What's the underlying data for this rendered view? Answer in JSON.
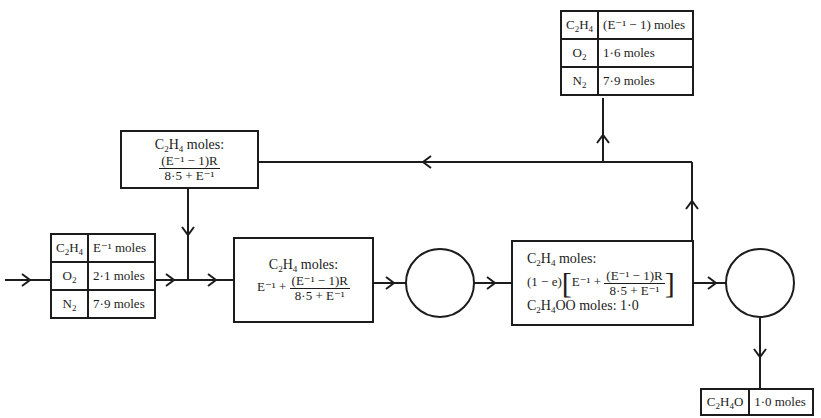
{
  "diagram": {
    "type": "process-flow",
    "colors": {
      "line": "#1c1c1c",
      "background": "#ffffff"
    },
    "feed_table": {
      "rows": [
        {
          "species": "C2H4",
          "species_html": "C<sub>2</sub>H<sub>4</sub>",
          "amount": "E⁻¹ moles"
        },
        {
          "species": "O2",
          "species_html": "O<sub>2</sub>",
          "amount": "2·1 moles"
        },
        {
          "species": "N2",
          "species_html": "N<sub>2</sub>",
          "amount": "7·9 moles"
        }
      ]
    },
    "purge_table": {
      "rows": [
        {
          "species": "C2H4",
          "species_html": "C<sub>2</sub>H<sub>4</sub>",
          "amount": "(E⁻¹ − 1) moles"
        },
        {
          "species": "O2",
          "species_html": "O<sub>2</sub>",
          "amount": "1·6 moles"
        },
        {
          "species": "N2",
          "species_html": "N<sub>2</sub>",
          "amount": "7·9 moles"
        }
      ]
    },
    "product_table": {
      "rows": [
        {
          "species": "C2H4O",
          "species_html": "C<sub>2</sub>H<sub>4</sub>O",
          "amount": "1·0 moles"
        }
      ]
    },
    "recycle_box": {
      "label": "moles:",
      "species": "C2H4",
      "numerator": "(E⁻¹ − 1)R",
      "denominator": "8·5 + E⁻¹"
    },
    "mixer_box": {
      "label": "moles:",
      "species": "C2H4",
      "prefix": "E⁻¹ +",
      "numerator": "(E⁻¹ − 1)R",
      "denominator": "8·5 + E⁻¹"
    },
    "reactor_effluent_box": {
      "label": "moles:",
      "species": "C2H4",
      "factor": "(1 − e)",
      "prefix": "E⁻¹ +",
      "numerator": "(E⁻¹ − 1)R",
      "denominator": "8·5 + E⁻¹",
      "product_line": "O moles: 1·0",
      "product_species": "C2H4O"
    },
    "units": [
      {
        "name": "reactor",
        "shape": "circle"
      },
      {
        "name": "separator",
        "shape": "circle"
      }
    ]
  }
}
